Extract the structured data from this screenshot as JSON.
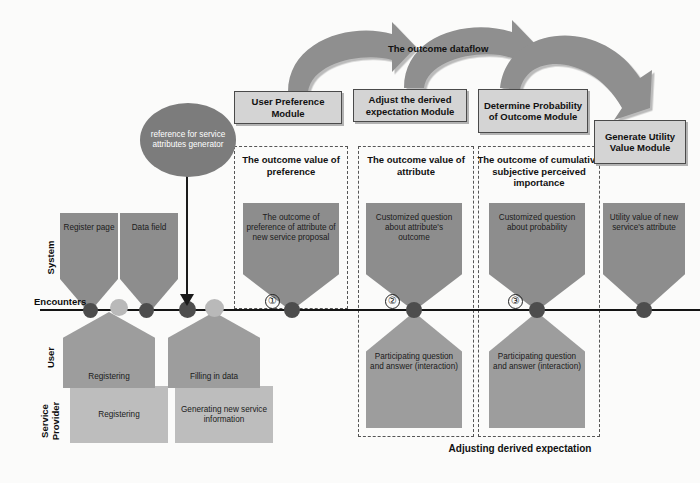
{
  "diagram": {
    "flow_label": "The outcome dataflow",
    "bottom_caption": "Adjusting derived expectation",
    "reference_node": "reference for service attributes generator",
    "lanes": [
      {
        "id": "system",
        "label": "System"
      },
      {
        "id": "encounters",
        "label": "Encounters"
      },
      {
        "id": "user",
        "label": "User"
      },
      {
        "id": "service-provider",
        "label": "Service\nProvider"
      }
    ],
    "lane_service_provider_line1": "Service",
    "lane_service_provider_line2": "Provider",
    "modules": [
      {
        "id": "user-preference",
        "label": "User Preference Module"
      },
      {
        "id": "adjust-derived-expectation",
        "label": "Adjust the derived expectation Module"
      },
      {
        "id": "determine-probability",
        "label": "Determine Probability of Outcome Module"
      },
      {
        "id": "generate-utility-value",
        "label": "Generate Utility Value Module"
      }
    ],
    "dash_groups": [
      {
        "id": "outcome-value-of-preference",
        "title": "The outcome value of preference"
      },
      {
        "id": "outcome-value-of-attribute",
        "title": "The outcome value of attribute"
      },
      {
        "id": "cumulative-subjective-perceived-importance",
        "title": "The outcome of cumulative subjective perceived importance"
      }
    ],
    "system_shapes": [
      {
        "id": "register-page",
        "label": "Register page"
      },
      {
        "id": "data-field",
        "label": "Data field"
      },
      {
        "id": "outcome-of-preference",
        "label": "The outcome of preference of attribute of new service proposal"
      },
      {
        "id": "customized-question-attribute-outcome",
        "label": "Customized question about attribute's outcome"
      },
      {
        "id": "customized-question-probability",
        "label": "Customized question about probability"
      },
      {
        "id": "utility-value-attribute",
        "label": "Utility value of new service's attribute"
      }
    ],
    "user_shapes": [
      {
        "id": "registering",
        "label": "Registering"
      },
      {
        "id": "filling-in-data",
        "label": "Filling in data"
      },
      {
        "id": "participating-qa-1",
        "label": "Participating question and answer (interaction)"
      },
      {
        "id": "participating-qa-2",
        "label": "Participating question and answer (interaction)"
      }
    ],
    "provider_shapes": [
      {
        "id": "registering-provider",
        "label": "Registering"
      },
      {
        "id": "generating-new-service-info",
        "label": "Generating new service information"
      }
    ],
    "encounter_markers": [
      "①",
      "②",
      "③"
    ],
    "colors": {
      "system_fill": "#8d8d8d",
      "user_fill": "#9d9d9d",
      "provider_fill": "#bdbdbd",
      "module_fill": "#d4d4d4",
      "arrow_fill": "#8f8f8f",
      "line": "#141414",
      "node_fill": "#7c7c7c"
    }
  }
}
